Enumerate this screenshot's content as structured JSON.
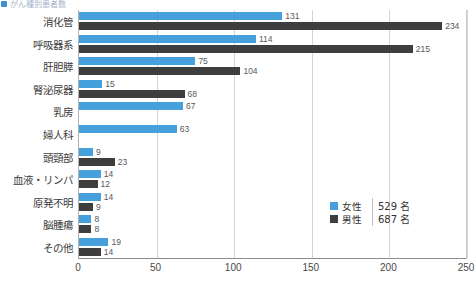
{
  "header": {
    "bullet_icon": "square-bullet-icon",
    "title_fragment": "がん種別患者数"
  },
  "legend": {
    "position": "inside-right",
    "entries": [
      {
        "label": "女性",
        "count": "529 名",
        "color": "#45a0dc",
        "swatch_icon": "legend-swatch-icon"
      },
      {
        "label": "男性",
        "count": "687 名",
        "color": "#3e3e3e",
        "swatch_icon": "legend-swatch-icon"
      }
    ]
  },
  "chart_data": {
    "type": "bar",
    "orientation": "horizontal",
    "title": "がん種別患者数",
    "xlabel": "",
    "ylabel": "",
    "xlim": [
      0,
      250
    ],
    "xticks": [
      0,
      50,
      100,
      150,
      200,
      250
    ],
    "xtick_labels": [
      "0",
      "50",
      "100",
      "150",
      "200",
      "250"
    ],
    "grid": true,
    "grid_axis": "x",
    "legend_position": "inside-right",
    "categories": [
      "消化管",
      "呼吸器系",
      "肝胆膵",
      "腎泌尿器",
      "乳房",
      "婦人科",
      "頭頸部",
      "血液・リンパ",
      "原発不明",
      "脳腫瘍",
      "その他"
    ],
    "series": [
      {
        "name": "女性",
        "color": "#45a0dc",
        "total": 529,
        "values": [
          131,
          114,
          75,
          15,
          67,
          63,
          9,
          14,
          14,
          8,
          19
        ]
      },
      {
        "name": "男性",
        "color": "#3e3e3e",
        "total": 687,
        "values": [
          234,
          215,
          104,
          68,
          0,
          0,
          23,
          12,
          9,
          8,
          14
        ]
      }
    ],
    "value_labels": {
      "女性": [
        "131",
        "114",
        "75",
        "15",
        "67",
        "63",
        "9",
        "14",
        "14",
        "8",
        "19"
      ],
      "男性": [
        "234",
        "215",
        "104",
        "68",
        "",
        "",
        "23",
        "12",
        "9",
        "8",
        "14"
      ]
    }
  }
}
